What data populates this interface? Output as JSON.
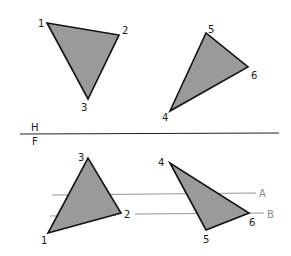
{
  "colors": {
    "fill": "#9a9a9a",
    "edge": "#111111",
    "reference_line": "#8a8a8a",
    "fold_line": "#222222"
  },
  "fold_line": {
    "upper_label": "H",
    "lower_label": "F"
  },
  "top_view": {
    "triangle_a": {
      "vertices": [
        {
          "label": "1",
          "x": 47,
          "y": 23
        },
        {
          "label": "2",
          "x": 119,
          "y": 35
        },
        {
          "label": "3",
          "x": 88,
          "y": 99
        }
      ]
    },
    "triangle_b": {
      "vertices": [
        {
          "label": "4",
          "x": 170,
          "y": 111
        },
        {
          "label": "5",
          "x": 206,
          "y": 33
        },
        {
          "label": "6",
          "x": 248,
          "y": 67
        }
      ]
    }
  },
  "front_view": {
    "triangle_a": {
      "vertices": [
        {
          "label": "1",
          "x": 48,
          "y": 233
        },
        {
          "label": "2",
          "x": 121,
          "y": 213
        },
        {
          "label": "3",
          "x": 88,
          "y": 158
        }
      ]
    },
    "triangle_b": {
      "vertices": [
        {
          "label": "4",
          "x": 170,
          "y": 163
        },
        {
          "label": "5",
          "x": 206,
          "y": 230
        },
        {
          "label": "6",
          "x": 249,
          "y": 213
        }
      ]
    },
    "reference_lines": [
      {
        "label": "A"
      },
      {
        "label": "B"
      }
    ]
  }
}
